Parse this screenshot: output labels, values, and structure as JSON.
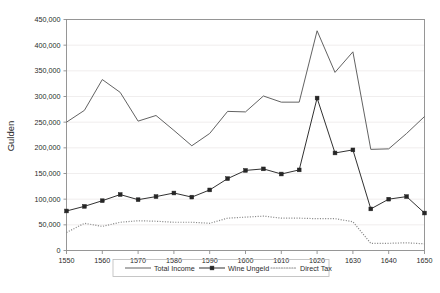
{
  "chart_data": {
    "type": "line",
    "title": "",
    "xlabel": "",
    "ylabel": "Gulden",
    "xlim": [
      1550,
      1650
    ],
    "ylim": [
      0,
      450000
    ],
    "ytick_labels": [
      "0",
      "50,000",
      "100,000",
      "150,000",
      "200,000",
      "250,000",
      "300,000",
      "350,000",
      "400,000",
      "450,000"
    ],
    "ytick_values": [
      0,
      50000,
      100000,
      150000,
      200000,
      250000,
      300000,
      350000,
      400000,
      450000
    ],
    "xtick_labels": [
      "1550",
      "1560",
      "1570",
      "1580",
      "1590",
      "1600",
      "1610",
      "1620",
      "1630",
      "1640",
      "1650"
    ],
    "xtick_values": [
      1550,
      1560,
      1570,
      1580,
      1590,
      1600,
      1610,
      1620,
      1630,
      1640,
      1650
    ],
    "x": [
      1550,
      1555,
      1560,
      1565,
      1570,
      1575,
      1580,
      1585,
      1590,
      1595,
      1600,
      1605,
      1610,
      1615,
      1620,
      1625,
      1630,
      1635,
      1640,
      1645,
      1650
    ],
    "grid": true,
    "legend_position": "bottom",
    "series": [
      {
        "name": "Total Income",
        "style": "solid",
        "marker": "none",
        "color": "#5a5a5a",
        "values": [
          250000,
          273000,
          333000,
          308000,
          252000,
          263000,
          234000,
          204000,
          228000,
          271000,
          270000,
          301000,
          289000,
          289000,
          428000,
          347000,
          387000,
          197000,
          198000,
          228000,
          261000
        ]
      },
      {
        "name": "Wine Ungeld",
        "style": "solid",
        "marker": "square",
        "color": "#262626",
        "values": [
          77000,
          86000,
          97000,
          109000,
          99000,
          105000,
          112000,
          104000,
          118000,
          140000,
          156000,
          159000,
          149000,
          157000,
          297000,
          190000,
          196000,
          81000,
          100000,
          105000,
          73000
        ]
      },
      {
        "name": "Direct Tax",
        "style": "dotted",
        "marker": "none",
        "color": "#8a8a8a",
        "values": [
          35000,
          53000,
          47000,
          55000,
          58000,
          57000,
          55000,
          55000,
          53000,
          63000,
          65000,
          67000,
          63000,
          63000,
          62000,
          62000,
          56000,
          14000,
          14000,
          15000,
          13000
        ]
      }
    ]
  },
  "legend": {
    "items": [
      {
        "label": "Total Income"
      },
      {
        "label": "Wine Ungeld"
      },
      {
        "label": "Direct Tax"
      }
    ]
  }
}
